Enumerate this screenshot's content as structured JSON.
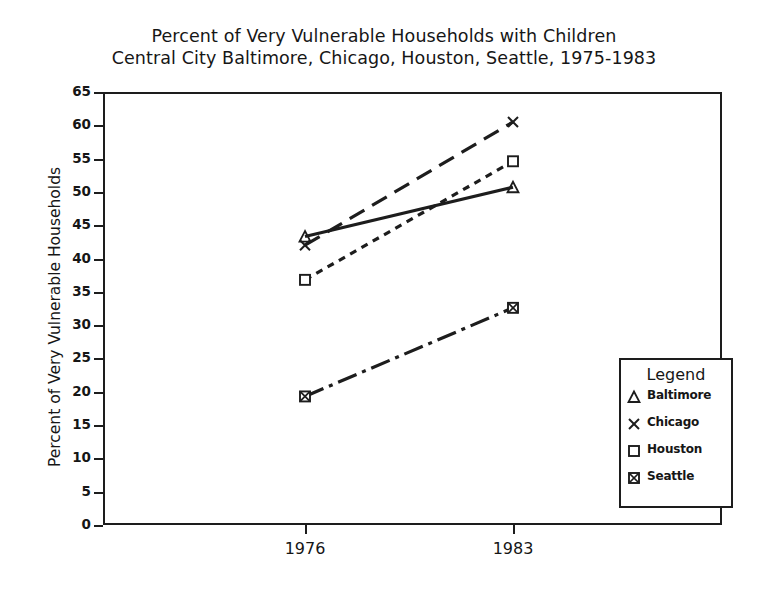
{
  "chart_data": {
    "type": "line",
    "title": "Percent of Very Vulnerable Households with Children",
    "subtitle": "Central City Baltimore, Chicago, Houston, Seattle, 1975-1983",
    "xlabel": "",
    "ylabel": "Percent of Very Vulnerable Households",
    "x": [
      "1976",
      "1983"
    ],
    "xtick_labels": [
      "1976",
      "1983"
    ],
    "ytick_labels": [
      "0",
      "5",
      "10",
      "15",
      "20",
      "25",
      "30",
      "35",
      "40",
      "45",
      "50",
      "55",
      "60",
      "65"
    ],
    "ylim": [
      0,
      65
    ],
    "ytick_step": 5,
    "grid": false,
    "legend_position": "bottom-right",
    "legend_title": "Legend",
    "series": [
      {
        "name": "Baltimore",
        "values": [
          43.3,
          50.7
        ],
        "marker": "triangle",
        "linestyle": "solid",
        "color": "#1d1d1d"
      },
      {
        "name": "Chicago",
        "values": [
          42.0,
          60.5
        ],
        "marker": "x",
        "linestyle": "long-dash",
        "color": "#1d1d1d"
      },
      {
        "name": "Houston",
        "values": [
          36.8,
          54.6
        ],
        "marker": "square",
        "linestyle": "short-dash",
        "color": "#1d1d1d"
      },
      {
        "name": "Seattle",
        "values": [
          19.3,
          32.6
        ],
        "marker": "crossed-square",
        "linestyle": "dash-dot",
        "color": "#1d1d1d"
      }
    ]
  },
  "colors": {
    "ink": "#1d1d1d",
    "background": "#ffffff"
  }
}
